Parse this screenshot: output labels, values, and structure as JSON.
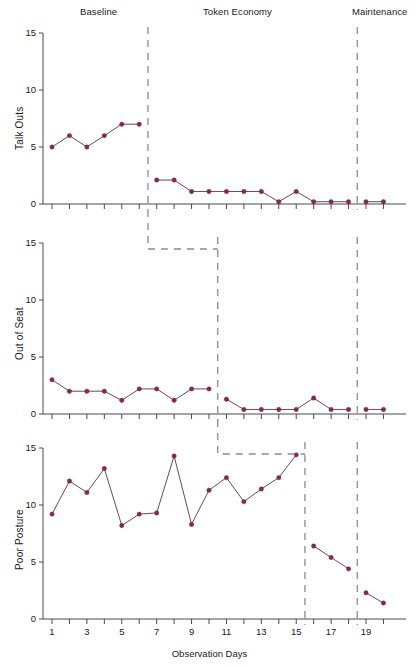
{
  "header": {
    "phases": [
      {
        "label": "Baseline",
        "x": 105,
        "y": 13
      },
      {
        "label": "Token Economy",
        "x": 237,
        "y": 13
      },
      {
        "label": "Maintenance",
        "x": 386,
        "y": 13
      }
    ]
  },
  "axis": {
    "xlabel": "Observation Days",
    "xticks": [
      1,
      3,
      5,
      7,
      9,
      11,
      13,
      15,
      17,
      19
    ],
    "yticks": [
      0,
      5,
      10,
      15
    ],
    "ylim": [
      0,
      15
    ],
    "xlim": [
      0.4,
      20.6
    ]
  },
  "colors": {
    "marker": "#8b2942",
    "line": "#6b4a52",
    "axis": "#4a4a4a",
    "phase": "#8c8c8c",
    "text": "#1a1a1a",
    "background": "#ffffff"
  },
  "chart_data": {
    "type": "line",
    "title": "",
    "xlabel": "Observation Days",
    "layout": "multiple-baseline, 3 stacked panels, shared x-axis",
    "grid": false,
    "legend": "none",
    "xlim": [
      0.4,
      20.6
    ],
    "ylim": [
      0,
      15
    ],
    "x": [
      1,
      2,
      3,
      4,
      5,
      6,
      7,
      8,
      9,
      10,
      11,
      12,
      13,
      14,
      15,
      16,
      17,
      18,
      19,
      20
    ],
    "phase_labels": [
      "Baseline",
      "Token Economy",
      "Maintenance"
    ],
    "panels": [
      {
        "ylabel": "Talk Outs",
        "yticks": [
          0,
          5,
          10,
          15
        ],
        "phase_lines": [
          6.5,
          18.5
        ],
        "segments": [
          {
            "phase": "Baseline",
            "x": [
              1,
              2,
              3,
              4,
              5,
              6
            ],
            "y": [
              5.0,
              6.0,
              5.0,
              6.0,
              7.0,
              7.0
            ]
          },
          {
            "phase": "Token Economy",
            "x": [
              7,
              8,
              9,
              10,
              11,
              12,
              13,
              14,
              15,
              16,
              17,
              18
            ],
            "y": [
              2.1,
              2.1,
              1.1,
              1.1,
              1.1,
              1.1,
              1.1,
              0.2,
              1.1,
              0.2,
              0.2,
              0.2
            ]
          },
          {
            "phase": "Maintenance",
            "x": [
              19,
              20
            ],
            "y": [
              0.2,
              0.2
            ]
          }
        ]
      },
      {
        "ylabel": "Out of Seat",
        "yticks": [
          0,
          5,
          10,
          15
        ],
        "phase_lines": [
          10.5,
          18.5
        ],
        "segments": [
          {
            "phase": "Baseline",
            "x": [
              1,
              2,
              3,
              4,
              5,
              6,
              7,
              8,
              9,
              10
            ],
            "y": [
              3.0,
              2.0,
              2.0,
              2.0,
              1.2,
              2.2,
              2.2,
              1.2,
              2.2,
              2.2
            ]
          },
          {
            "phase": "Token Economy",
            "x": [
              11,
              12,
              13,
              14,
              15,
              16,
              17,
              18
            ],
            "y": [
              1.3,
              0.4,
              0.4,
              0.4,
              0.4,
              1.4,
              0.4,
              0.4
            ]
          },
          {
            "phase": "Maintenance",
            "x": [
              19,
              20
            ],
            "y": [
              0.4,
              0.4
            ]
          }
        ]
      },
      {
        "ylabel": "Poor Posture",
        "yticks": [
          0,
          5,
          10,
          15
        ],
        "phase_lines": [
          15.5,
          18.5
        ],
        "segments": [
          {
            "phase": "Baseline",
            "x": [
              1,
              2,
              3,
              4,
              5,
              6,
              7,
              8,
              9,
              10,
              11,
              12,
              13,
              14,
              15
            ],
            "y": [
              9.2,
              12.1,
              11.1,
              13.2,
              8.2,
              9.2,
              9.3,
              14.3,
              8.3,
              11.3,
              12.4,
              10.3,
              11.4,
              12.4,
              14.4
            ]
          },
          {
            "phase": "Token Economy",
            "x": [
              16,
              17,
              18
            ],
            "y": [
              6.4,
              5.4,
              4.4
            ]
          },
          {
            "phase": "Maintenance",
            "x": [
              19,
              20
            ],
            "y": [
              2.3,
              1.4
            ]
          }
        ]
      }
    ]
  }
}
